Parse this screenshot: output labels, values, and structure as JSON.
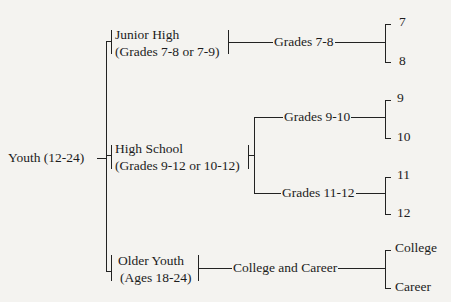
{
  "diagram": {
    "type": "tree",
    "root": {
      "label": "Youth (12-24)"
    },
    "groups": [
      {
        "line1": "Junior High",
        "line2": "(Grades 7-8 or 7-9)",
        "children": [
          {
            "label": "Grades 7-8",
            "leaves": [
              "7",
              "8"
            ]
          }
        ]
      },
      {
        "line1": "High School",
        "line2": "(Grades 9-12 or 10-12)",
        "children": [
          {
            "label": "Grades 9-10",
            "leaves": [
              "9",
              "10"
            ]
          },
          {
            "label": "Grades 11-12",
            "leaves": [
              "11",
              "12"
            ]
          }
        ]
      },
      {
        "line1": "Older Youth",
        "line2": "(Ages 18-24)",
        "children": [
          {
            "label": "College and Career",
            "leaves": [
              "College",
              "Career"
            ]
          }
        ]
      }
    ]
  },
  "colors": {
    "background": "#f4f3f0",
    "ink": "#1c1c1c"
  }
}
